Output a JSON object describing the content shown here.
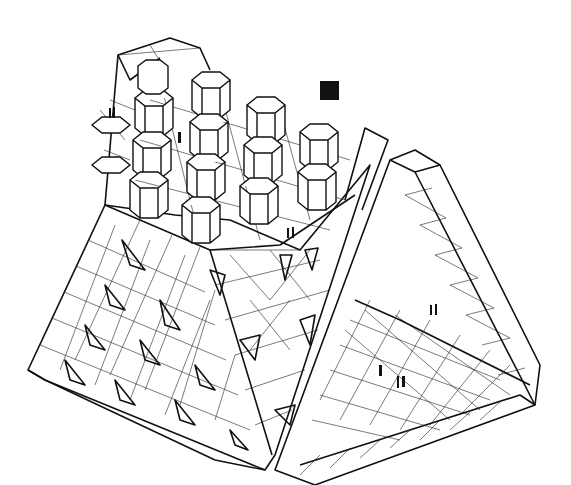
{
  "figure": {
    "colors": {
      "line": "#111111",
      "background": "#ffffff"
    },
    "elements": {
      "hex_towers": 16,
      "human_figure_groups": 6,
      "black_square_marker": 1,
      "pyramid_recesses": 16
    }
  }
}
